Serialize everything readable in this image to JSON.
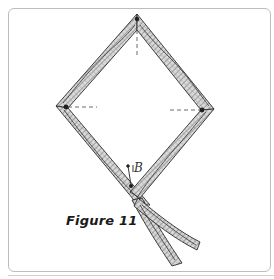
{
  "figure": {
    "caption": "Figure 11",
    "point_label": "B"
  },
  "colors": {
    "stroke": "#2b2b2b",
    "hatch": "#555555",
    "frame": "#bdbdbd",
    "background": "#ffffff"
  }
}
